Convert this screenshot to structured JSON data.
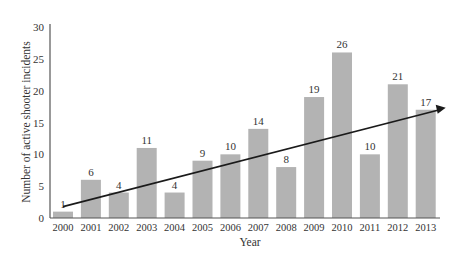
{
  "chart_data": {
    "type": "bar",
    "title": "",
    "xlabel": "Year",
    "ylabel": "Number of active shooter incidents",
    "categories": [
      "2000",
      "2001",
      "2002",
      "2003",
      "2004",
      "2005",
      "2006",
      "2007",
      "2008",
      "2009",
      "2010",
      "2011",
      "2012",
      "2013"
    ],
    "values": [
      1,
      6,
      4,
      11,
      4,
      9,
      10,
      14,
      8,
      19,
      26,
      10,
      21,
      17
    ],
    "ylim": [
      0,
      30
    ],
    "yticks": [
      0,
      5,
      10,
      15,
      20,
      25,
      30
    ],
    "grid": false,
    "legend": null,
    "data_labels": true,
    "annotations": [
      {
        "type": "trend-arrow",
        "from": {
          "x": "2000",
          "y": 1
        },
        "to": {
          "x": "2013",
          "y": 17
        },
        "description": "Linear trend arrow rising from 2000 to 2013"
      }
    ],
    "colors": {
      "bar": "#b3b3b3",
      "axis": "#555555",
      "text": "#333333",
      "arrow": "#1a1a1a"
    }
  }
}
